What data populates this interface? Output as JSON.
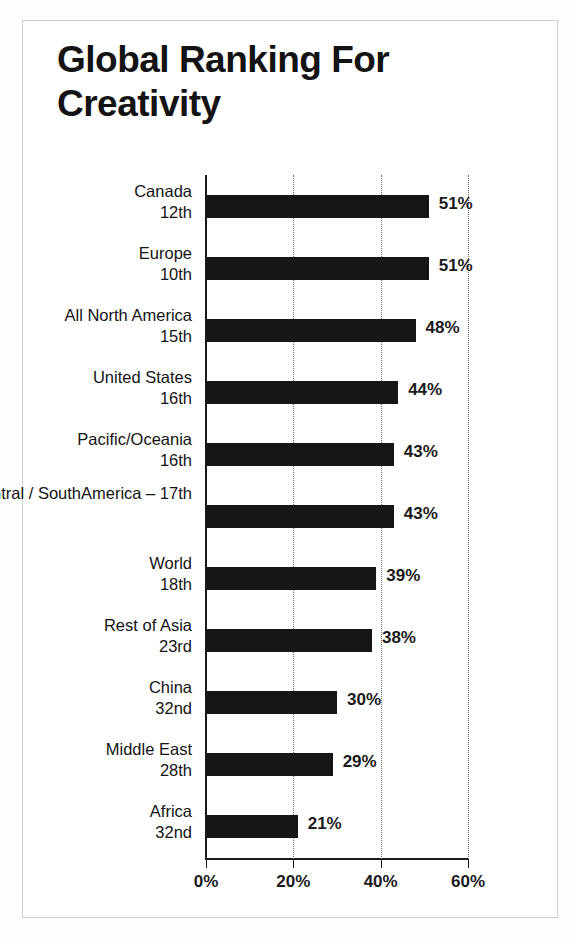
{
  "chart_title": "Global Ranking For Creativity",
  "chart_data": {
    "type": "bar",
    "orientation": "horizontal",
    "title": "Global Ranking For Creativity",
    "xlabel": "",
    "ylabel": "",
    "xlim": [
      0,
      60
    ],
    "xticks": [
      "0%",
      "20%",
      "40%",
      "60%"
    ],
    "xtick_values": [
      0,
      20,
      40,
      60
    ],
    "grid": "vertical-dotted",
    "legend": "none",
    "bar_color": "#161616",
    "categories": [
      "Canada",
      "Europe",
      "All North America",
      "United States",
      "Pacific/Oceania",
      "Central / South America – 17th",
      "World",
      "Rest of Asia",
      "China",
      "Middle East",
      "Africa"
    ],
    "ranks": [
      "12th",
      "10th",
      "15th",
      "16th",
      "16th",
      "",
      "18th",
      "23rd",
      "32nd",
      "28th",
      "32nd"
    ],
    "values": [
      51,
      51,
      48,
      44,
      43,
      43,
      39,
      38,
      30,
      29,
      21
    ],
    "value_labels": [
      "51%",
      "51%",
      "48%",
      "44%",
      "43%",
      "43%",
      "39%",
      "38%",
      "30%",
      "29%",
      "21%"
    ],
    "rows": [
      {
        "name": "Canada",
        "rank": "12th",
        "value": 51,
        "value_label": "51%",
        "label_lines": [
          "Canada",
          "12th"
        ]
      },
      {
        "name": "Europe",
        "rank": "10th",
        "value": 51,
        "value_label": "51%",
        "label_lines": [
          "Europe",
          "10th"
        ]
      },
      {
        "name": "All North America",
        "rank": "15th",
        "value": 48,
        "value_label": "48%",
        "label_lines": [
          "All North America",
          "15th"
        ]
      },
      {
        "name": "United States",
        "rank": "16th",
        "value": 44,
        "value_label": "44%",
        "label_lines": [
          "United States",
          "16th"
        ]
      },
      {
        "name": "Pacific/Oceania",
        "rank": "16th",
        "value": 43,
        "value_label": "43%",
        "label_lines": [
          "Pacific/Oceania",
          "16th"
        ]
      },
      {
        "name": "Central / South America",
        "rank": "17th",
        "value": 43,
        "value_label": "43%",
        "label_lines": [
          "Central / South",
          "America – 17th"
        ]
      },
      {
        "name": "World",
        "rank": "18th",
        "value": 39,
        "value_label": "39%",
        "label_lines": [
          "World",
          "18th"
        ]
      },
      {
        "name": "Rest of Asia",
        "rank": "23rd",
        "value": 38,
        "value_label": "38%",
        "label_lines": [
          "Rest of Asia",
          "23rd"
        ]
      },
      {
        "name": "China",
        "rank": "32nd",
        "value": 30,
        "value_label": "30%",
        "label_lines": [
          "China",
          "32nd"
        ]
      },
      {
        "name": "Middle East",
        "rank": "28th",
        "value": 29,
        "value_label": "29%",
        "label_lines": [
          "Middle East",
          "28th"
        ]
      },
      {
        "name": "Africa",
        "rank": "32nd",
        "value": 21,
        "value_label": "21%",
        "label_lines": [
          "Africa",
          "32nd"
        ]
      }
    ]
  }
}
